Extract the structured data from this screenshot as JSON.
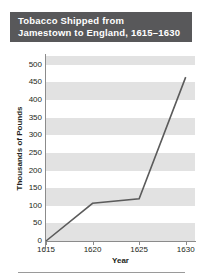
{
  "title": {
    "line1": "Tobacco Shipped from",
    "line2": "Jamestown to England, 1615–1630"
  },
  "colors": {
    "title_bar_bg": "#58585a",
    "title_text": "#ffffff",
    "band": "#e2e2e2",
    "plot_bg": "#ffffff",
    "axis": "#8b8b8b",
    "line": "#5b5b5b",
    "text": "#231f20"
  },
  "chart_data": {
    "type": "line",
    "title": "Tobacco Shipped from Jamestown to England, 1615–1630",
    "xlabel": "Year",
    "ylabel": "Thousands of Pounds",
    "x": [
      1615,
      1620,
      1625,
      1630
    ],
    "values": [
      0,
      107,
      120,
      465
    ],
    "series": [
      {
        "name": "Tobacco shipped",
        "values": [
          0,
          107,
          120,
          465
        ]
      }
    ],
    "xlim": [
      1615,
      1631
    ],
    "ylim": [
      0,
      525
    ],
    "xticks": [
      1615,
      1620,
      1625,
      1630
    ],
    "xtick_labels": [
      "1615",
      "1620",
      "1625",
      "1630"
    ],
    "yticks": [
      0,
      50,
      100,
      150,
      200,
      250,
      300,
      350,
      400,
      450,
      500
    ],
    "ytick_labels": [
      "0",
      "50",
      "100",
      "150",
      "200",
      "250",
      "300",
      "350",
      "400",
      "450",
      "500"
    ],
    "grid": false,
    "banded_background": true,
    "legend": null,
    "markers": false
  }
}
